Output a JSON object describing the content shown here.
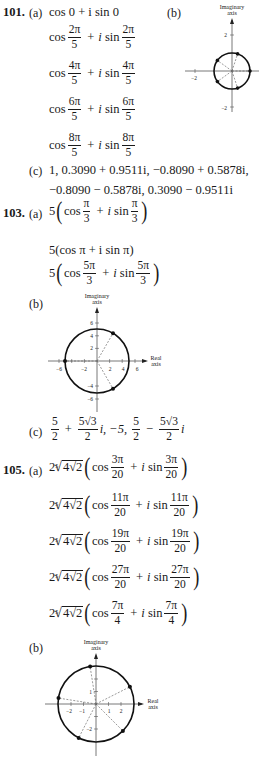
{
  "problem_101": {
    "number": "101.",
    "part_a_label": "(a)",
    "part_a_lines": [
      {
        "plain": "cos 0 + i sin 0"
      },
      {
        "num": "2π",
        "den": "5"
      },
      {
        "num": "4π",
        "den": "5"
      },
      {
        "num": "6π",
        "den": "5"
      },
      {
        "num": "8π",
        "den": "5"
      }
    ],
    "part_b_label": "(b)",
    "graph": {
      "y_axis_label_1": "Imaginary",
      "y_axis_label_2": "axis",
      "tick_x_neg": "−2",
      "tick_y_pos": "2",
      "tick_y_neg": "−2",
      "radius": 1,
      "points_deg": [
        0,
        72,
        144,
        216,
        288
      ]
    },
    "part_c_label": "(c)",
    "part_c_line1": "1, 0.3090 + 0.9511i,  −0.8090 + 0.5878i,",
    "part_c_line2": "−0.8090 − 0.5878i, 0.3090 − 0.9511i"
  },
  "problem_103": {
    "number": "103.",
    "part_a_label": "(a)",
    "part_a_lines": [
      {
        "coef": "5",
        "num": "π",
        "den": "3"
      },
      {
        "plain": "5(cos π + i sin π)"
      },
      {
        "coef": "5",
        "num": "5π",
        "den": "3"
      }
    ],
    "part_b_label": "(b)",
    "graph": {
      "y_axis_label_1": "Imaginary",
      "y_axis_label_2": "axis",
      "x_axis_label_1": "Real",
      "x_axis_label_2": "axis",
      "x_ticks": [
        "−6",
        "−2",
        "2",
        "4",
        "6"
      ],
      "y_ticks": [
        "6",
        "4",
        "2",
        "−4",
        "−6"
      ],
      "radius": 5,
      "points_deg": [
        60,
        180,
        300
      ]
    },
    "part_c_label": "(c)",
    "part_c": {
      "t1_num": "5",
      "t1_den": "2",
      "t2_num": "5√3",
      "t2_den": "2",
      "middle": "i,  −5,",
      "t3_num": "5",
      "t3_den": "2",
      "t4_num": "5√3",
      "t4_den": "2",
      "tail": "i"
    }
  },
  "problem_105": {
    "number": "105.",
    "part_a_label": "(a)",
    "modulus_coef": "2",
    "modulus_root_index": "5",
    "modulus_radicand": "4√2",
    "part_a_lines": [
      {
        "num": "3π",
        "den": "20"
      },
      {
        "num": "11π",
        "den": "20"
      },
      {
        "num": "19π",
        "den": "20"
      },
      {
        "num": "27π",
        "den": "20"
      },
      {
        "num": "7π",
        "den": "4"
      }
    ],
    "part_b_label": "(b)",
    "graph": {
      "y_axis_label_1": "Imaginary",
      "y_axis_label_2": "axis",
      "x_axis_label_1": "Real",
      "x_axis_label_2": "axis",
      "x_ticks": [
        "−2",
        "−1",
        "1",
        "2"
      ],
      "y_ticks": [
        "1",
        "−2"
      ],
      "radius": 2.83,
      "points_deg": [
        27,
        99,
        171,
        243,
        315
      ]
    }
  },
  "words": {
    "cos": "cos",
    "sin": "sin",
    "plus": "+",
    "i": "i",
    "minus": "−"
  }
}
